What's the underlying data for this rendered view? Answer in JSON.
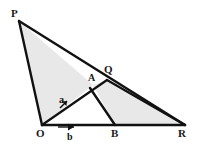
{
  "figure": {
    "type": "geometry-diagram",
    "background_color": "#ffffff",
    "stroke_color": "#111111",
    "fill_color": "#e8e8e8",
    "width": 198,
    "height": 147
  },
  "points": {
    "P": {
      "label": "P",
      "x": 19,
      "y": 21,
      "label_x": 11,
      "label_y": 8
    },
    "O": {
      "label": "O",
      "x": 42,
      "y": 125,
      "label_x": 36,
      "label_y": 128
    },
    "A": {
      "label": "A",
      "x": 93,
      "y": 85,
      "label_x": 88,
      "label_y": 73
    },
    "Q": {
      "label": "Q",
      "x": 107,
      "y": 80,
      "label_x": 104,
      "label_y": 66
    },
    "B": {
      "label": "B",
      "x": 115,
      "y": 125,
      "label_x": 111,
      "label_y": 128
    },
    "R": {
      "label": "R",
      "x": 185,
      "y": 125,
      "label_x": 179,
      "label_y": 128
    }
  },
  "vectors": {
    "a": {
      "label": "a",
      "label_x": 59,
      "label_y": 96,
      "from": "O",
      "toward": "A"
    },
    "b": {
      "label": "b",
      "label_x": 67,
      "label_y": 133,
      "from": "O",
      "toward": "R"
    }
  },
  "shaded_regions": [
    {
      "name": "triangle-P-O-A",
      "vertices": "P,O,A"
    },
    {
      "name": "quad-A-Q-R-B",
      "vertices": "A,Q,R,B"
    }
  ],
  "segments": [
    {
      "name": "segment-P-O",
      "from": "P",
      "to": "O"
    },
    {
      "name": "segment-P-R",
      "from": "P",
      "to": "R"
    },
    {
      "name": "segment-O-Q",
      "from": "O",
      "to": "Q"
    },
    {
      "name": "segment-Q-R",
      "from": "Q",
      "to": "R"
    },
    {
      "name": "segment-A-B",
      "from": "A",
      "to": "B"
    },
    {
      "name": "segment-O-R",
      "from": "O",
      "to": "R"
    }
  ]
}
